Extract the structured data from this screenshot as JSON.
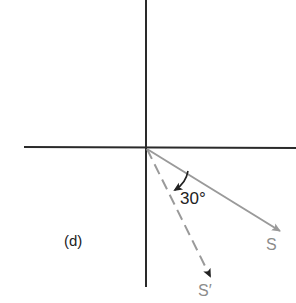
{
  "panel_label": "(d)",
  "angle_label": "30°",
  "vectors": [
    {
      "name": "S",
      "label": "S",
      "style": "solid",
      "color": "#9a9a9a"
    },
    {
      "name": "S-prime",
      "label": "S′",
      "style": "dashed",
      "color": "#9a9a9a"
    }
  ],
  "axes": {
    "color": "#2a2a2a"
  }
}
